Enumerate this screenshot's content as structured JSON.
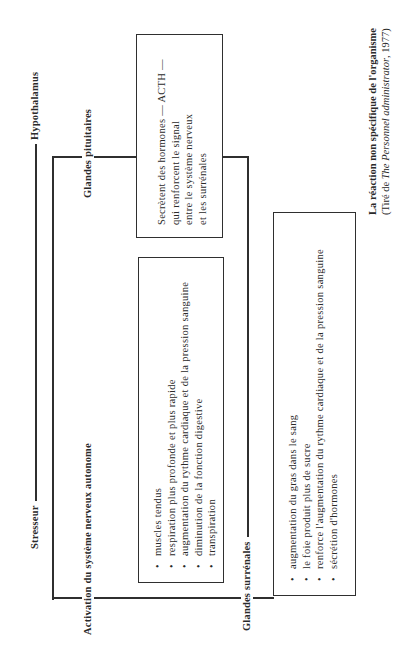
{
  "diagram": {
    "top_axis": {
      "left_label": "Stresseur",
      "right_label": "Hypothalamus"
    },
    "branch_labels": {
      "pituitary": "Glandes pituitaires",
      "autonomic": "Activation du système nerveux autonome",
      "adrenal": "Glandes surrénales"
    },
    "pituitary_box": {
      "lines": [
        "Secrètent des hormones — ACTH —",
        "qui renforcent le signal",
        "entre le système nerveux",
        "et les surrénales"
      ]
    },
    "autonomic_box": {
      "items": [
        "muscles tendus",
        "respiration plus profonde et plus rapide",
        "augmentation du rythme cardiaque et de la pression sanguine",
        "diminution de la fonction digestive",
        "transpiration"
      ]
    },
    "adrenal_box": {
      "items": [
        "augmentation du gras dans le sang",
        "le foie produit plus de sucre",
        "renforce l'augmentation du rythme cardiaque et de la pression sanguine",
        "sécrétion d'hormones"
      ]
    },
    "caption": {
      "title": "La réaction non spécifique de l'organisme",
      "source_prefix": "(Tiré de ",
      "source_italic": "The Personnel administrator",
      "source_suffix": ", 1977)"
    }
  }
}
